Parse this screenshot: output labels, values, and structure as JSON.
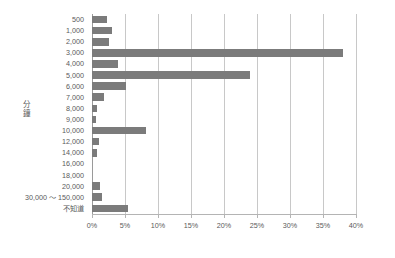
{
  "chart_data": {
    "type": "bar",
    "orientation": "horizontal",
    "title": "",
    "xlabel": "",
    "ylabel": "分鐘",
    "xlim": [
      0,
      40
    ],
    "xticks": [
      "0%",
      "5%",
      "10%",
      "15%",
      "20%",
      "25%",
      "30%",
      "35%",
      "40%"
    ],
    "xtick_values": [
      0,
      5,
      10,
      15,
      20,
      25,
      30,
      35,
      40
    ],
    "grid": true,
    "legend": "none",
    "bar_color": "#7b7b7b",
    "categories": [
      "500",
      "1,000",
      "2,000",
      "3,000",
      "4,000",
      "5,000",
      "6,000",
      "7,000",
      "8,000",
      "9,000",
      "10,000",
      "12,000",
      "14,000",
      "16,000",
      "18,000",
      "20,000",
      "30,000 ～ 150,000",
      "不知道"
    ],
    "values": [
      2.3,
      3.1,
      2.5,
      38.0,
      4.0,
      24.0,
      5.1,
      1.8,
      0.8,
      0.6,
      8.2,
      1.1,
      0.7,
      0.0,
      0.0,
      1.2,
      1.5,
      5.5
    ]
  }
}
